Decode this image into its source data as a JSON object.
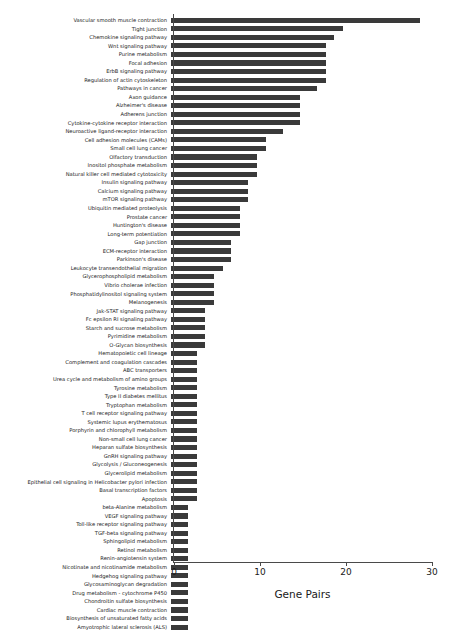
{
  "chart_data": {
    "type": "bar",
    "orientation": "horizontal",
    "title": "",
    "xlabel": "Gene Pairs",
    "ylabel": "",
    "xlim": [
      0,
      31
    ],
    "xticks": [
      0,
      10,
      20,
      30
    ],
    "grid": false,
    "legend": null,
    "bar_color": "#3a3a3a",
    "categories": [
      "Vascular smooth muscle contraction",
      "Tight junction",
      "Chemokine signaling pathway",
      "Wnt signaling pathway",
      "Purine metabolism",
      "Focal adhesion",
      "ErbB signaling pathway",
      "Regulation of actin cytoskeleton",
      "Pathways in cancer",
      "Axon guidance",
      "Alzheimer's disease",
      "Adherens junction",
      "Cytokine-cytokine receptor interaction",
      "Neuroactive ligand-receptor interaction",
      "Cell adhesion molecules (CAMs)",
      "Small cell lung cancer",
      "Olfactory transduction",
      "Inositol phosphate metabolism",
      "Natural killer cell mediated cytotoxicity",
      "Insulin signaling pathway",
      "Calcium signaling pathway",
      "mTOR signaling pathway",
      "Ubiquitin mediated proteolysis",
      "Prostate cancer",
      "Huntington's disease",
      "Long-term potentiation",
      "Gap junction",
      "ECM-receptor interaction",
      "Parkinson's disease",
      "Leukocyte transendothelial migration",
      "Glycerophospholipid metabolism",
      "Vibrio cholerae infection",
      "Phosphatidylinositol signaling system",
      "Melanogenesis",
      "Jak-STAT signaling pathway",
      "Fc epsilon RI signaling pathway",
      "Starch and sucrose metabolism",
      "Pyrimidine metabolism",
      "O-Glycan biosynthesis",
      "Hematopoietic cell lineage",
      "Complement and coagulation cascades",
      "ABC transporters",
      "Urea cycle and metabolism of amino groups",
      "Tyrosine metabolism",
      "Type II diabetes mellitus",
      "Tryptophan metabolism",
      "T cell receptor signaling pathway",
      "Systemic lupus erythematosus",
      "Porphyrin and chlorophyll metabolism",
      "Non-small cell lung cancer",
      "Heparan sulfate biosynthesis",
      "GnRH signaling pathway",
      "Glycolysis / Gluconeogenesis",
      "Glycerolipid metabolism",
      "Epithelial cell signaling in Helicobacter pylori infection",
      "Basal transcription factors",
      "Apoptosis",
      "beta-Alanine metabolism",
      "VEGF signaling pathway",
      "Toll-like receptor signaling pathway",
      "TGF-beta signaling pathway",
      "Sphingolipid metabolism",
      "Retinol metabolism",
      "Renin-angiotensin system",
      "Nicotinate and nicotinamide metabolism",
      "Hedgehog signaling pathway",
      "Glycosaminoglycan degradation",
      "Drug metabolism - cytochrome P450",
      "Chondroitin sulfate biosynthesis",
      "Cardiac muscle contraction",
      "Biosynthesis of unsaturated fatty acids",
      "Amyotrophic lateral sclerosis (ALS)"
    ],
    "values": [
      29,
      20,
      19,
      18,
      18,
      18,
      18,
      18,
      17,
      15,
      15,
      15,
      15,
      13,
      11,
      11,
      10,
      10,
      10,
      9,
      9,
      9,
      8,
      8,
      8,
      8,
      7,
      7,
      7,
      6,
      5,
      5,
      5,
      5,
      4,
      4,
      4,
      4,
      4,
      3,
      3,
      3,
      3,
      3,
      3,
      3,
      3,
      3,
      3,
      3,
      3,
      3,
      3,
      3,
      3,
      3,
      3,
      2,
      2,
      2,
      2,
      2,
      2,
      2,
      2,
      2,
      2,
      2,
      2,
      2,
      2,
      2
    ]
  }
}
